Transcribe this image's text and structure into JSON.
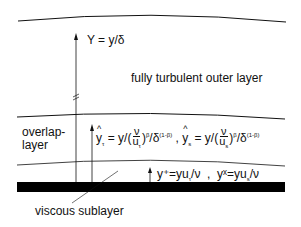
{
  "labels": {
    "outer_coordinate": "Y = y/δ",
    "outer_layer": "fully turbulent outer layer",
    "overlap_layer_line1": "overlap-",
    "overlap_layer_line2": "layer",
    "viscous_sublayer": "viscous sublayer"
  },
  "formulas": {
    "overlap_tau": {
      "lhs_var": "y",
      "lhs_sub": "τ",
      "eq": " = y/(",
      "num": "ν",
      "den": "u",
      "den_sub": "τ",
      "exp": "β",
      "tail": "/δ",
      "tail_exp": "(1-β)"
    },
    "separator": " , ",
    "overlap_s": {
      "lhs_var": "y",
      "lhs_sub": "s",
      "eq": " = y/(",
      "num": "ν",
      "den": "u",
      "den_sub": "s",
      "exp": "β",
      "tail": "/δ",
      "tail_exp": "(1-β)"
    },
    "wall_plus": "y⁺=yu",
    "wall_plus_sub": "τ",
    "wall_plus_tail": "/ν",
    "wall_sep": "  ,  ",
    "wall_x": "yˣ=yu",
    "wall_x_sub": "s",
    "wall_x_tail": "/ν"
  },
  "colors": {
    "ink": "#111111",
    "wall": "#000000",
    "background": "#ffffff"
  }
}
